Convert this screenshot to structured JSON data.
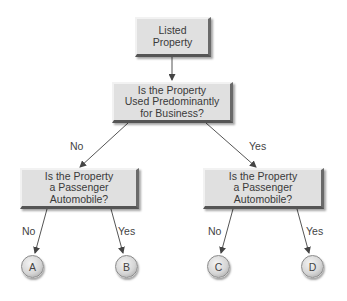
{
  "diagram": {
    "type": "decision-tree",
    "root": {
      "label": "Listed\nProperty"
    },
    "question1": {
      "label": "Is the Property\nUsed Predominantly\nfor Business?"
    },
    "question_left": {
      "label": "Is the Property\na Passenger\nAutomobile?"
    },
    "question_right": {
      "label": "Is the Property\na Passenger\nAutomobile?"
    },
    "edges": {
      "q1_no": "No",
      "q1_yes": "Yes",
      "left_no": "No",
      "left_yes": "Yes",
      "right_no": "No",
      "right_yes": "Yes"
    },
    "outcomes": [
      "A",
      "B",
      "C",
      "D"
    ],
    "colors": {
      "box_fill": "#e0e0e0",
      "line": "#555555",
      "text": "#3a3a3a"
    }
  }
}
